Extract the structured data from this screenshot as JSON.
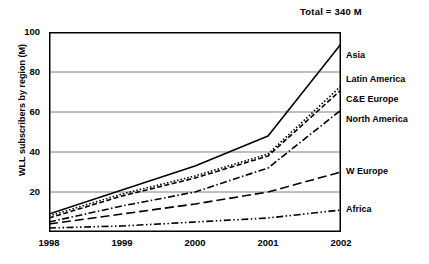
{
  "chart_data": {
    "type": "line",
    "title": "Total = 340 M",
    "xlabel": "",
    "ylabel": "WLL subscribers by region (M)",
    "x": [
      1998,
      1999,
      2000,
      2001,
      2002
    ],
    "xticklabels": [
      "1998",
      "1999",
      "2000",
      "2001",
      "2002"
    ],
    "yticks": [
      0,
      20,
      40,
      60,
      80,
      100
    ],
    "yticklabels": [
      "20",
      "40",
      "60",
      "80",
      "100"
    ],
    "ylim": [
      0,
      100
    ],
    "xlim": [
      1998,
      2002
    ],
    "grid": "horizontal",
    "legend_position": "right-inline",
    "series": [
      {
        "name": "Asia",
        "style": "solid",
        "values": [
          9,
          21,
          33,
          48,
          94
        ],
        "label_y_value": 88
      },
      {
        "name": "Latin America",
        "style": "dotted",
        "values": [
          8,
          19,
          28,
          39,
          73
        ],
        "label_y_value": 76
      },
      {
        "name": "C&E Europe",
        "style": "dashed",
        "values": [
          7,
          18,
          27,
          38,
          71
        ],
        "label_y_value": 66
      },
      {
        "name": "North America",
        "style": "dash-dot",
        "values": [
          5,
          13,
          20,
          32,
          61
        ],
        "label_y_value": 56
      },
      {
        "name": "W Europe",
        "style": "long-dash",
        "values": [
          4,
          9,
          14,
          20,
          30
        ],
        "label_y_value": 30
      },
      {
        "name": "Africa",
        "style": "dash-dot-dot",
        "values": [
          2,
          3,
          5,
          7,
          11
        ],
        "label_y_value": 11
      }
    ]
  }
}
